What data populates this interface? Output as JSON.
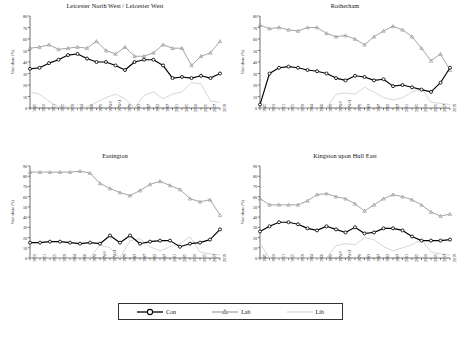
{
  "figure": {
    "ylabel": "Vote share (%)",
    "legend": {
      "items": [
        {
          "label": "Con",
          "color": "#000000",
          "marker": "circle"
        },
        {
          "label": "Lab",
          "color": "#9a9a9a",
          "marker": "triangle"
        },
        {
          "label": "Lib",
          "color": "#d2d2d2",
          "marker": "none"
        }
      ]
    }
  },
  "chart_data": [
    {
      "type": "line",
      "title": "Leicester North West / Leicester West",
      "xlabel": "",
      "ylabel": "Vote share (%)",
      "ylim": [
        0,
        80
      ],
      "yticks": [
        0,
        10,
        20,
        30,
        40,
        50,
        60,
        70,
        80
      ],
      "grid": false,
      "legend_position": "figure-bottom",
      "categories": [
        "1945",
        "1950",
        "1951",
        "1955",
        "1959",
        "1964",
        "1966",
        "1970",
        "1974-F",
        "1974-O",
        "1979",
        "1983",
        "1987",
        "1992",
        "1997",
        "2001",
        "2005",
        "2010",
        "2015",
        "2017",
        "2019"
      ],
      "series": [
        {
          "name": "Con",
          "color": "#000000",
          "values": [
            34,
            35,
            39,
            42,
            46,
            47,
            43,
            40,
            40,
            37,
            33,
            40,
            42,
            42,
            37,
            26,
            27,
            26,
            28,
            26,
            30,
            35
          ]
        },
        {
          "name": "Lab",
          "color": "#9a9a9a",
          "values": [
            52,
            53,
            55,
            51,
            52,
            53,
            52,
            58,
            50,
            47,
            53,
            45,
            45,
            48,
            55,
            52,
            52,
            37,
            45,
            48,
            58,
            47
          ]
        },
        {
          "name": "Lib",
          "color": "#d2d2d2",
          "values": [
            14,
            12,
            6,
            1,
            1,
            0,
            1,
            5,
            9,
            12,
            8,
            0,
            11,
            14,
            8,
            12,
            14,
            22,
            21,
            6,
            5,
            5
          ]
        }
      ]
    },
    {
      "type": "line",
      "title": "Rotherham",
      "xlabel": "",
      "ylabel": "Vote share (%)",
      "ylim": [
        0,
        80
      ],
      "yticks": [
        0,
        10,
        20,
        30,
        40,
        50,
        60,
        70,
        80
      ],
      "grid": false,
      "categories": [
        "1945",
        "1950",
        "1951",
        "1955",
        "1959",
        "1964",
        "1966",
        "1970",
        "1974-F",
        "1974-O",
        "1979",
        "1983",
        "1987",
        "1992",
        "1997",
        "2001",
        "2005",
        "2010",
        "2015",
        "2017",
        "2019"
      ],
      "series": [
        {
          "name": "Con",
          "color": "#000000",
          "values": [
            3,
            30,
            35,
            36,
            35,
            33,
            32,
            30,
            26,
            24,
            28,
            27,
            24,
            25,
            19,
            20,
            18,
            16,
            14,
            22,
            35
          ]
        },
        {
          "name": "Lab",
          "color": "#9a9a9a",
          "values": [
            72,
            69,
            70,
            68,
            67,
            70,
            70,
            65,
            62,
            63,
            60,
            55,
            62,
            67,
            71,
            68,
            62,
            52,
            41,
            47,
            33
          ]
        },
        {
          "name": "Lib",
          "color": "#d2d2d2",
          "values": [
            0,
            0,
            0,
            0,
            0,
            0,
            0,
            0,
            12,
            13,
            12,
            18,
            14,
            9,
            7,
            9,
            14,
            17,
            5,
            4,
            3
          ]
        }
      ]
    },
    {
      "type": "line",
      "title": "Easington",
      "xlabel": "",
      "ylabel": "Vote share (%)",
      "ylim": [
        0,
        90
      ],
      "yticks": [
        0,
        10,
        20,
        30,
        40,
        50,
        60,
        70,
        80,
        90
      ],
      "grid": false,
      "categories": [
        "1950",
        "1951",
        "1955",
        "1959",
        "1964",
        "1966",
        "1970",
        "1974-F",
        "1974-O",
        "1979",
        "1983",
        "1987",
        "1992",
        "1997",
        "2001",
        "2005",
        "2010",
        "2015",
        "2017",
        "2019"
      ],
      "series": [
        {
          "name": "Con",
          "color": "#000000",
          "values": [
            15,
            15,
            16,
            16,
            15,
            14,
            15,
            14,
            22,
            15,
            22,
            14,
            16,
            17,
            17,
            11,
            14,
            15,
            18,
            28
          ]
        },
        {
          "name": "Lab",
          "color": "#9a9a9a",
          "values": [
            84,
            84,
            84,
            84,
            84,
            85,
            83,
            73,
            68,
            64,
            61,
            66,
            72,
            75,
            71,
            67,
            58,
            55,
            57,
            42
          ]
        },
        {
          "name": "Lib",
          "color": "#d2d2d2",
          "values": [
            0,
            0,
            0,
            0,
            0,
            0,
            0,
            13,
            10,
            0,
            17,
            19,
            11,
            7,
            11,
            14,
            21,
            6,
            4,
            3
          ]
        }
      ]
    },
    {
      "type": "line",
      "title": "Kingston upon Hull East",
      "xlabel": "",
      "ylabel": "Vote share (%)",
      "ylim": [
        0,
        90
      ],
      "yticks": [
        0,
        10,
        20,
        30,
        40,
        50,
        60,
        70,
        80,
        90
      ],
      "grid": false,
      "categories": [
        "1945",
        "1950",
        "1951",
        "1955",
        "1959",
        "1964",
        "1966",
        "1970",
        "1974-F",
        "1974-O",
        "1979",
        "1983",
        "1987",
        "1992",
        "1997",
        "2001",
        "2005",
        "2010",
        "2015",
        "2017",
        "2019"
      ],
      "series": [
        {
          "name": "Con",
          "color": "#000000",
          "values": [
            26,
            31,
            35,
            35,
            33,
            29,
            27,
            31,
            28,
            25,
            30,
            24,
            25,
            29,
            29,
            27,
            21,
            17,
            17,
            17,
            18,
            25,
            32
          ]
        },
        {
          "name": "Lab",
          "color": "#9a9a9a",
          "values": [
            58,
            52,
            52,
            52,
            52,
            56,
            62,
            63,
            60,
            58,
            53,
            46,
            52,
            58,
            62,
            60,
            57,
            52,
            45,
            41,
            43,
            50,
            36
          ]
        },
        {
          "name": "Lib",
          "color": "#d2d2d2",
          "values": [
            14,
            0,
            0,
            0,
            0,
            0,
            0,
            0,
            12,
            14,
            13,
            20,
            18,
            11,
            7,
            10,
            13,
            18,
            6,
            4,
            3
          ]
        }
      ]
    }
  ]
}
